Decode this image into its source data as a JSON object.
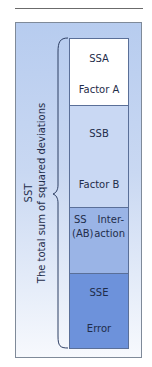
{
  "diagram": {
    "total": {
      "abbr": "SST",
      "label": "The total sum of squared deviations"
    },
    "components": [
      {
        "abbr": "SSA",
        "label": "Factor A",
        "color": "#ffffff"
      },
      {
        "abbr": "SSB",
        "label": "Factor B",
        "color": "#c9d8f3"
      },
      {
        "abbr_line1": "SS",
        "abbr_line2": "(AB)",
        "label_line1": "Inter-",
        "label_line2": "action",
        "color": "#9ab4e6"
      },
      {
        "abbr": "SSE",
        "label": "Error",
        "color": "#6d92db"
      }
    ]
  }
}
